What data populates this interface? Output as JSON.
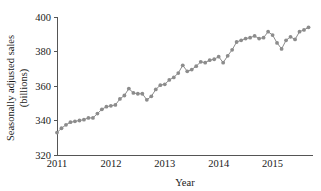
{
  "chart_data": {
    "type": "line",
    "title": "",
    "subtitle": "",
    "xlabel": "Year",
    "ylabel": "Seasonally adjusted sales (billions)",
    "ylabel_line1": "Seasonally adjusted sales",
    "ylabel_line2": "(billions)",
    "ylim": [
      320,
      400
    ],
    "xlim": [
      2011.0,
      2015.75
    ],
    "ytick_labels": [
      "320",
      "340",
      "360",
      "380",
      "400"
    ],
    "yticks": [
      320,
      340,
      360,
      380,
      400
    ],
    "xtick_labels": [
      "2011",
      "2012",
      "2013",
      "2014",
      "2015"
    ],
    "xticks": [
      2011,
      2012,
      2013,
      2014,
      2015
    ],
    "grid": false,
    "legend": "none",
    "marker": "filled-circle",
    "marker_color": "#8c8c8c",
    "line_color": "#8c8c8c",
    "axis_color": "#555555",
    "background_color": "#ffffff",
    "series": [
      {
        "name": "Seasonally adjusted sales",
        "x": [
          2011.0,
          2011.083,
          2011.167,
          2011.25,
          2011.333,
          2011.417,
          2011.5,
          2011.583,
          2011.667,
          2011.75,
          2011.833,
          2011.917,
          2012.0,
          2012.083,
          2012.167,
          2012.25,
          2012.333,
          2012.417,
          2012.5,
          2012.583,
          2012.667,
          2012.75,
          2012.833,
          2012.917,
          2013.0,
          2013.083,
          2013.167,
          2013.25,
          2013.333,
          2013.417,
          2013.5,
          2013.583,
          2013.667,
          2013.75,
          2013.833,
          2013.917,
          2014.0,
          2014.083,
          2014.167,
          2014.25,
          2014.333,
          2014.417,
          2014.5,
          2014.583,
          2014.667,
          2014.75,
          2014.833,
          2014.917,
          2015.0,
          2015.083,
          2015.167,
          2015.25,
          2015.333,
          2015.417,
          2015.5,
          2015.583,
          2015.667
        ],
        "values": [
          333.0,
          335.5,
          337.5,
          339.0,
          339.5,
          340.0,
          340.5,
          341.5,
          341.5,
          344.0,
          346.5,
          348.0,
          348.5,
          349.0,
          352.5,
          354.5,
          358.5,
          356.0,
          355.5,
          355.5,
          352.0,
          354.0,
          358.0,
          360.5,
          361.0,
          363.5,
          365.0,
          367.5,
          372.0,
          368.5,
          369.5,
          371.5,
          374.0,
          373.5,
          375.0,
          375.5,
          377.0,
          373.5,
          377.5,
          381.0,
          385.5,
          386.5,
          387.5,
          388.0,
          389.0,
          387.5,
          388.0,
          391.5,
          389.5,
          385.0,
          381.5,
          386.5,
          388.5,
          387.0,
          391.5,
          392.5,
          394.0
        ]
      }
    ]
  },
  "figure": {
    "plot_area": {
      "left_px": 57,
      "right_px": 313,
      "top_px": 17,
      "bottom_px": 155
    }
  }
}
